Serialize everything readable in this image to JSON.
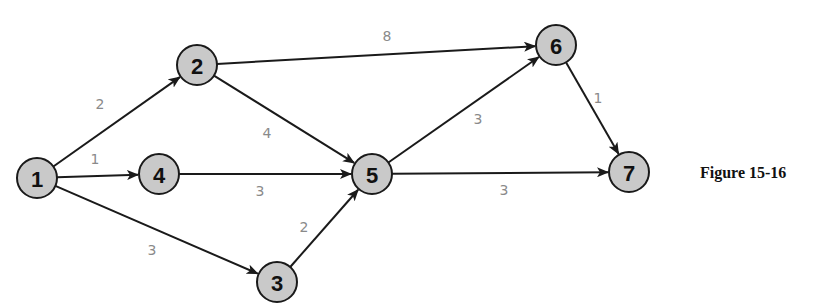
{
  "diagram": {
    "caption": "Figure 15-16",
    "node_radius": 20,
    "nodes": [
      {
        "id": "1",
        "label": "1",
        "x": 37,
        "y": 178
      },
      {
        "id": "2",
        "label": "2",
        "x": 197,
        "y": 65
      },
      {
        "id": "3",
        "label": "3",
        "x": 277,
        "y": 282
      },
      {
        "id": "4",
        "label": "4",
        "x": 159,
        "y": 174
      },
      {
        "id": "5",
        "label": "5",
        "x": 372,
        "y": 174
      },
      {
        "id": "6",
        "label": "6",
        "x": 556,
        "y": 45
      },
      {
        "id": "7",
        "label": "7",
        "x": 629,
        "y": 172
      }
    ],
    "edges": [
      {
        "from": "1",
        "to": "2",
        "weight": "2",
        "lx": 100,
        "ly": 104
      },
      {
        "from": "1",
        "to": "4",
        "weight": "1",
        "lx": 95,
        "ly": 159
      },
      {
        "from": "1",
        "to": "3",
        "weight": "3",
        "lx": 152,
        "ly": 250
      },
      {
        "from": "2",
        "to": "6",
        "weight": "8",
        "lx": 387,
        "ly": 36
      },
      {
        "from": "2",
        "to": "5",
        "weight": "4",
        "lx": 267,
        "ly": 133
      },
      {
        "from": "4",
        "to": "5",
        "weight": "3",
        "lx": 260,
        "ly": 191
      },
      {
        "from": "3",
        "to": "5",
        "weight": "2",
        "lx": 304,
        "ly": 227
      },
      {
        "from": "5",
        "to": "6",
        "weight": "3",
        "lx": 478,
        "ly": 119
      },
      {
        "from": "5",
        "to": "7",
        "weight": "3",
        "lx": 504,
        "ly": 190
      },
      {
        "from": "6",
        "to": "7",
        "weight": "1",
        "lx": 598,
        "ly": 98
      }
    ]
  }
}
